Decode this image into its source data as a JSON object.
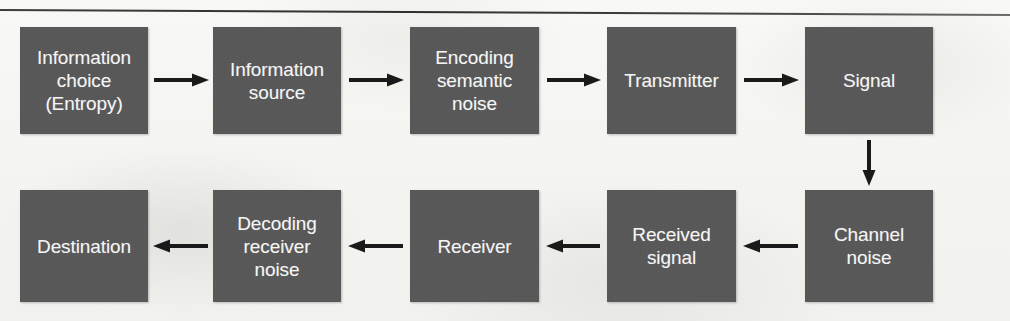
{
  "diagram": {
    "box_fill_color": "#565656",
    "box_text_color": "#ffffff",
    "arrow_color": "#1a1a1a",
    "background_color": "#f6f6f4",
    "rule_color": "#333333",
    "top_row": [
      {
        "id": "information-choice-entropy",
        "lines": "Information\nchoice\n(Entropy)"
      },
      {
        "id": "information-source",
        "lines": "Information\nsource"
      },
      {
        "id": "encoding-semantic-noise",
        "lines": "Encoding\nsemantic\nnoise"
      },
      {
        "id": "transmitter",
        "lines": "Transmitter"
      },
      {
        "id": "signal",
        "lines": "Signal"
      }
    ],
    "bottom_row": [
      {
        "id": "destination",
        "lines": "Destination"
      },
      {
        "id": "decoding-receiver-noise",
        "lines": "Decoding\nreceiver\nnoise"
      },
      {
        "id": "receiver",
        "lines": "Receiver"
      },
      {
        "id": "received-signal",
        "lines": "Received\nsignal"
      },
      {
        "id": "channel-noise",
        "lines": "Channel\nnoise"
      }
    ],
    "connectors": [
      {
        "id": "arrow-choice-to-source",
        "direction": "right"
      },
      {
        "id": "arrow-source-to-encoding",
        "direction": "right"
      },
      {
        "id": "arrow-encoding-to-transmitter",
        "direction": "right"
      },
      {
        "id": "arrow-transmitter-to-signal",
        "direction": "right"
      },
      {
        "id": "arrow-signal-to-channel-noise",
        "direction": "down"
      },
      {
        "id": "arrow-channel-noise-to-received-signal",
        "direction": "left"
      },
      {
        "id": "arrow-received-signal-to-receiver",
        "direction": "left"
      },
      {
        "id": "arrow-receiver-to-decoding",
        "direction": "left"
      },
      {
        "id": "arrow-decoding-to-destination",
        "direction": "left"
      }
    ]
  }
}
